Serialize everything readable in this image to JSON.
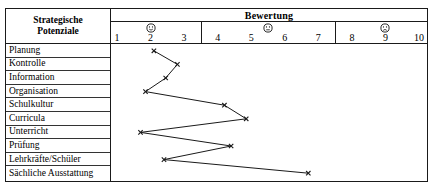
{
  "table": {
    "row_header_title_line1": "Strategische",
    "row_header_title_line2": "Potenziale",
    "scale_title": "Bewertung"
  },
  "chart_data": {
    "type": "line",
    "title": "Bewertung",
    "xlabel": "",
    "ylabel": "Strategische Potenziale",
    "orientation": "horizontal",
    "xlim": [
      1,
      10
    ],
    "grid": false,
    "legend": false,
    "tick_labels": [
      "1",
      "2",
      "3",
      "4",
      "5",
      "6",
      "7",
      "8",
      "9",
      "10"
    ],
    "tick_values": [
      1,
      2,
      3,
      4,
      5,
      6,
      7,
      8,
      9,
      10
    ],
    "group_dividers": [
      3.5,
      7.5
    ],
    "faces": [
      {
        "name": "smiley-happy-icon",
        "glyph": "happy",
        "at_value": 2
      },
      {
        "name": "smiley-neutral-icon",
        "glyph": "neutral",
        "at_value": 5.5
      },
      {
        "name": "smiley-sad-icon",
        "glyph": "sad",
        "at_value": 9
      }
    ],
    "categories": [
      "Planung",
      "Kontrolle",
      "Information",
      "Organisation",
      "Schulkultur",
      "Curricula",
      "Unterricht",
      "Prüfung",
      "Lehrkräfte/Schüler",
      "Sächliche Ausstattung"
    ],
    "values": [
      2.1,
      2.8,
      2.45,
      1.85,
      4.2,
      4.85,
      1.7,
      4.4,
      2.4,
      6.7
    ],
    "marker": "x",
    "line_color": "#1a1a1a"
  }
}
